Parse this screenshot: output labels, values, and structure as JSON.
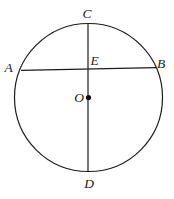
{
  "figure": {
    "type": "geometry-diagram",
    "labels": {
      "top": "C",
      "bottom": "D",
      "chord_left": "A",
      "chord_right": "B",
      "intersection": "E",
      "center": "O"
    },
    "colors": {
      "stroke": "#1b1b1b",
      "background": "#ffffff"
    }
  }
}
